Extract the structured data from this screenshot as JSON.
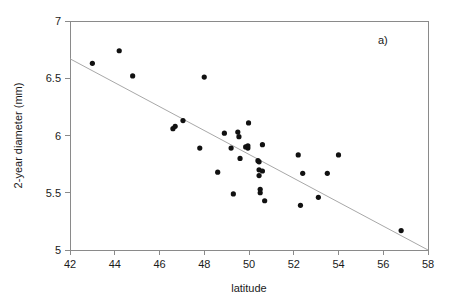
{
  "panel": {
    "label": "a)"
  },
  "chart_data": {
    "type": "scatter",
    "title": "",
    "subtitle": "",
    "xlabel": "latitude",
    "ylabel": "2-year diameter (mm)",
    "xlim": [
      42,
      58
    ],
    "ylim": [
      5,
      7
    ],
    "xticks": [
      42,
      44,
      46,
      48,
      50,
      52,
      54,
      56,
      58
    ],
    "xtick_labels": [
      "42",
      "44",
      "46",
      "48",
      "50",
      "52",
      "54",
      "56",
      "58"
    ],
    "yticks": [
      5,
      5.5,
      6,
      6.5,
      7
    ],
    "ytick_labels": [
      "5",
      "5.5",
      "6",
      "6.5",
      "7"
    ],
    "grid": false,
    "legend": null,
    "marker": "filled-circle",
    "marker_color": "#111111",
    "axis_color": "#8a8a8a",
    "series": [
      {
        "name": "2-year diameter vs latitude",
        "points": [
          [
            43.0,
            6.63
          ],
          [
            44.2,
            6.74
          ],
          [
            44.8,
            6.52
          ],
          [
            46.6,
            6.06
          ],
          [
            46.7,
            6.08
          ],
          [
            47.05,
            6.13
          ],
          [
            47.8,
            5.89
          ],
          [
            48.0,
            6.51
          ],
          [
            48.6,
            5.68
          ],
          [
            48.9,
            6.02
          ],
          [
            49.2,
            5.89
          ],
          [
            49.3,
            5.49
          ],
          [
            49.5,
            6.03
          ],
          [
            49.55,
            5.99
          ],
          [
            49.6,
            5.8
          ],
          [
            49.85,
            5.9
          ],
          [
            49.95,
            5.89
          ],
          [
            49.95,
            5.91
          ],
          [
            49.98,
            6.11
          ],
          [
            50.4,
            5.78
          ],
          [
            50.45,
            5.77
          ],
          [
            50.45,
            5.7
          ],
          [
            50.45,
            5.65
          ],
          [
            50.5,
            5.53
          ],
          [
            50.5,
            5.5
          ],
          [
            50.6,
            5.92
          ],
          [
            50.6,
            5.69
          ],
          [
            50.7,
            5.43
          ],
          [
            52.2,
            5.83
          ],
          [
            52.3,
            5.39
          ],
          [
            52.4,
            5.67
          ],
          [
            53.1,
            5.46
          ],
          [
            53.5,
            5.67
          ],
          [
            54.0,
            5.83
          ],
          [
            56.8,
            5.17
          ]
        ]
      }
    ],
    "fit_line": {
      "name": "least-squares regression line",
      "color": "#a8a8a8",
      "x_start": 42.0,
      "y_start": 6.67,
      "x_end": 58.0,
      "y_end": 5.0
    }
  }
}
